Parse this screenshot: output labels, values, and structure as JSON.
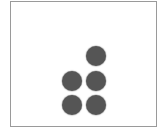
{
  "frame": {
    "border_color": "#9a9a9a",
    "background": "#ffffff"
  },
  "dots": {
    "color": "#555555",
    "diameter": 20,
    "count": 5,
    "items": [
      {
        "row": 0,
        "col": 1,
        "cx": 96,
        "cy": 56
      },
      {
        "row": 1,
        "col": 0,
        "cx": 72,
        "cy": 81
      },
      {
        "row": 1,
        "col": 1,
        "cx": 96,
        "cy": 81
      },
      {
        "row": 2,
        "col": 0,
        "cx": 72,
        "cy": 105
      },
      {
        "row": 2,
        "col": 1,
        "cx": 96,
        "cy": 105
      }
    ]
  }
}
